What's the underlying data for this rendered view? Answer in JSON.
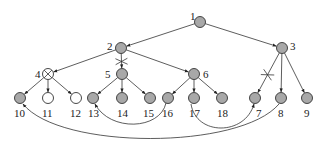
{
  "diagram": {
    "type": "tree-with-cross-links",
    "colors": {
      "filled_node": "#a8a8a8",
      "empty_node": "#ffffff",
      "stroke": "#333333"
    },
    "nodes": [
      {
        "id": "1",
        "label": "1",
        "x": 200,
        "y": 22,
        "style": "filled",
        "lx": 190,
        "ly": 20
      },
      {
        "id": "2",
        "label": "2",
        "x": 121,
        "y": 48,
        "style": "filled",
        "lx": 107,
        "ly": 50
      },
      {
        "id": "3",
        "label": "3",
        "x": 282,
        "y": 48,
        "style": "filled",
        "lx": 290,
        "ly": 50
      },
      {
        "id": "4",
        "label": "4",
        "x": 48,
        "y": 74,
        "style": "crossed",
        "lx": 35,
        "ly": 78
      },
      {
        "id": "5",
        "label": "5",
        "x": 122,
        "y": 74,
        "style": "filled",
        "lx": 105,
        "ly": 78
      },
      {
        "id": "6",
        "label": "6",
        "x": 194,
        "y": 74,
        "style": "filled",
        "lx": 203,
        "ly": 78
      },
      {
        "id": "7",
        "label": "7",
        "x": 255,
        "y": 98,
        "style": "filled",
        "lx": 256,
        "ly": 117
      },
      {
        "id": "8",
        "label": "8",
        "x": 281,
        "y": 98,
        "style": "filled",
        "lx": 278,
        "ly": 117
      },
      {
        "id": "9",
        "label": "9",
        "x": 307,
        "y": 98,
        "style": "filled",
        "lx": 304,
        "ly": 117
      },
      {
        "id": "10",
        "label": "10",
        "x": 20,
        "y": 98,
        "style": "filled",
        "lx": 14,
        "ly": 117
      },
      {
        "id": "11",
        "label": "11",
        "x": 48,
        "y": 98,
        "style": "empty",
        "lx": 42,
        "ly": 117
      },
      {
        "id": "12",
        "label": "12",
        "x": 76,
        "y": 98,
        "style": "empty",
        "lx": 70,
        "ly": 117
      },
      {
        "id": "13",
        "label": "13",
        "x": 93,
        "y": 98,
        "style": "filled",
        "lx": 88,
        "ly": 117
      },
      {
        "id": "14",
        "label": "14",
        "x": 122,
        "y": 98,
        "style": "filled",
        "lx": 117,
        "ly": 117
      },
      {
        "id": "15",
        "label": "15",
        "x": 150,
        "y": 98,
        "style": "filled",
        "lx": 143,
        "ly": 117
      },
      {
        "id": "16",
        "label": "16",
        "x": 168,
        "y": 98,
        "style": "filled",
        "lx": 162,
        "ly": 117
      },
      {
        "id": "17",
        "label": "17",
        "x": 194,
        "y": 98,
        "style": "filled",
        "lx": 189,
        "ly": 117
      },
      {
        "id": "18",
        "label": "18",
        "x": 222,
        "y": 98,
        "style": "filled",
        "lx": 217,
        "ly": 117
      }
    ],
    "edges": [
      {
        "from": "1",
        "to": "2",
        "blocked": false
      },
      {
        "from": "1",
        "to": "3",
        "blocked": false
      },
      {
        "from": "2",
        "to": "4",
        "blocked": false
      },
      {
        "from": "2",
        "to": "5",
        "blocked": true
      },
      {
        "from": "2",
        "to": "6",
        "blocked": false
      },
      {
        "from": "3",
        "to": "7",
        "blocked": true
      },
      {
        "from": "3",
        "to": "8",
        "blocked": false
      },
      {
        "from": "3",
        "to": "9",
        "blocked": false
      },
      {
        "from": "4",
        "to": "10",
        "blocked": false
      },
      {
        "from": "4",
        "to": "11",
        "blocked": false
      },
      {
        "from": "4",
        "to": "12",
        "blocked": false
      },
      {
        "from": "5",
        "to": "13",
        "blocked": false
      },
      {
        "from": "5",
        "to": "14",
        "blocked": false
      },
      {
        "from": "5",
        "to": "15",
        "blocked": false
      },
      {
        "from": "6",
        "to": "16",
        "blocked": false
      },
      {
        "from": "6",
        "to": "17",
        "blocked": false
      },
      {
        "from": "6",
        "to": "18",
        "blocked": false
      }
    ],
    "cross_links": [
      {
        "from": "16",
        "to": "13",
        "path": "M166,103 C160,130 110,132 95,104"
      },
      {
        "from": "17",
        "to": "7",
        "path": "M191,104 C196,136 245,136 254,104"
      },
      {
        "from": "8",
        "to": "10",
        "path": "M279,104 C240,150 60,150 23,104"
      }
    ]
  }
}
